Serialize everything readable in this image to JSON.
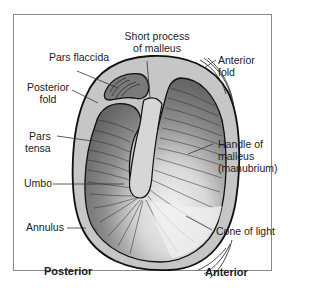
{
  "diagram": {
    "labels": {
      "short_process": [
        "Short process",
        "of malleus"
      ],
      "pars_flaccida": "Pars flaccida",
      "posterior_fold": [
        "Posterior",
        "fold"
      ],
      "pars_tensa": [
        "Pars",
        "tensa"
      ],
      "umbo": "Umbo",
      "annulus": "Annulus",
      "anterior_fold": [
        "Anterior",
        "fold"
      ],
      "handle_of_malleus": [
        "Handle of",
        "malleus",
        "(manubrium)"
      ],
      "cone_of_light": "Cone of light"
    },
    "orientation": {
      "left": "Posterior",
      "right": "Anterior"
    },
    "colors": {
      "annulus_fill": "#c8c8c8",
      "membrane_dark": "#6e6e6e",
      "membrane_mid": "#9a9a9a",
      "cone_of_light": "#ececec",
      "outline": "#1a1a1a",
      "frame": "#8a8a8a"
    }
  }
}
